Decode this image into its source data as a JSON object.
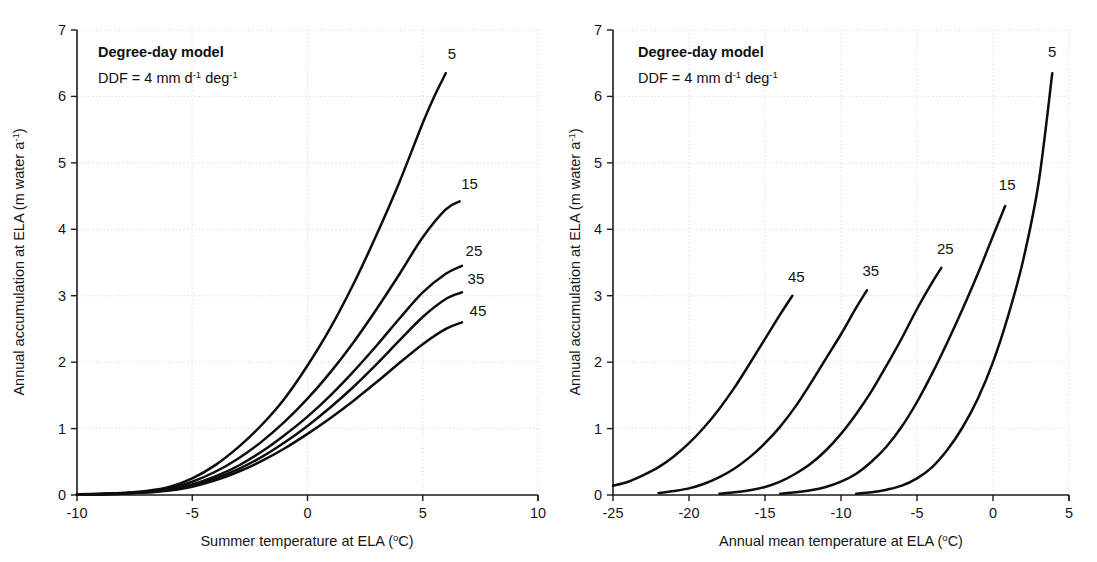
{
  "figure": {
    "background": "#ffffff",
    "line_color": "#0d0d0d",
    "grid_color": "#d2d2d2"
  },
  "panels": [
    {
      "id": "left",
      "annotation_title": "Degree-day model",
      "annotation_sub_main": "DDF = 4 mm d",
      "annotation_sub_exp1": "-1",
      "annotation_sub_mid": " deg",
      "annotation_sub_exp2": "-1",
      "xlabel_main": "Summer temperature at ELA (",
      "xlabel_deg": "o",
      "xlabel_tail": "C)",
      "ylabel_main": "Annual accumulation at ELA (m water a",
      "ylabel_exp": "-1",
      "ylabel_tail": ")",
      "xticks": [
        "-10",
        "-5",
        "0",
        "5",
        "10"
      ],
      "yticks": [
        "0",
        "1",
        "2",
        "3",
        "4",
        "5",
        "6",
        "7"
      ],
      "series_labels": [
        "5",
        "15",
        "25",
        "35",
        "45"
      ]
    },
    {
      "id": "right",
      "annotation_title": "Degree-day model",
      "annotation_sub_main": "DDF = 4 mm d",
      "annotation_sub_exp1": "-1",
      "annotation_sub_mid": " deg",
      "annotation_sub_exp2": "-1",
      "xlabel_main": "Annual mean temperature at ELA (",
      "xlabel_deg": "o",
      "xlabel_tail": "C)",
      "ylabel_main": "Annual accumulation at ELA (m water a",
      "ylabel_exp": "-1",
      "ylabel_tail": ")",
      "xticks": [
        "-25",
        "-20",
        "-15",
        "-10",
        "-5",
        "0",
        "5"
      ],
      "yticks": [
        "0",
        "1",
        "2",
        "3",
        "4",
        "5",
        "6",
        "7"
      ],
      "series_labels": [
        "45",
        "35",
        "25",
        "15",
        "5"
      ]
    }
  ],
  "chart_data": [
    {
      "type": "line",
      "id": "left-panel",
      "title": "Degree-day model",
      "annotation": "DDF = 4 mm d-1 deg-1",
      "xlabel": "Summer temperature at ELA (oC)",
      "ylabel": "Annual accumulation at ELA (m water a-1)",
      "xlim": [
        -10,
        10
      ],
      "ylim": [
        0,
        7
      ],
      "xticks": [
        -10,
        -5,
        0,
        5,
        10
      ],
      "yticks": [
        0,
        1,
        2,
        3,
        4,
        5,
        6,
        7
      ],
      "grid": true,
      "legend": "inline-curve-labels",
      "series": [
        {
          "name": "5",
          "x": [
            -10,
            -9,
            -8,
            -7,
            -6,
            -5,
            -4,
            -3,
            -2,
            -1,
            0,
            1,
            2,
            3,
            4,
            5,
            5.5,
            6.0
          ],
          "values": [
            0.01,
            0.02,
            0.03,
            0.06,
            0.12,
            0.25,
            0.45,
            0.72,
            1.05,
            1.45,
            1.95,
            2.52,
            3.18,
            3.92,
            4.72,
            5.6,
            6.0,
            6.35
          ]
        },
        {
          "name": "15",
          "x": [
            -10,
            -9,
            -8,
            -7,
            -6,
            -5,
            -4,
            -3,
            -2,
            -1,
            0,
            1,
            2,
            3,
            4,
            5,
            6,
            6.6
          ],
          "values": [
            0.01,
            0.015,
            0.03,
            0.05,
            0.1,
            0.2,
            0.35,
            0.55,
            0.8,
            1.1,
            1.45,
            1.85,
            2.3,
            2.8,
            3.33,
            3.88,
            4.3,
            4.42
          ]
        },
        {
          "name": "25",
          "x": [
            -10,
            -9,
            -8,
            -7,
            -6,
            -5,
            -4,
            -3,
            -2,
            -1,
            0,
            1,
            2,
            3,
            4,
            5,
            6,
            6.7
          ],
          "values": [
            0.01,
            0.012,
            0.025,
            0.045,
            0.085,
            0.16,
            0.28,
            0.44,
            0.65,
            0.9,
            1.18,
            1.5,
            1.86,
            2.25,
            2.66,
            3.05,
            3.33,
            3.45
          ]
        },
        {
          "name": "35",
          "x": [
            -10,
            -9,
            -8,
            -7,
            -6,
            -5,
            -4,
            -3,
            -2,
            -1,
            0,
            1,
            2,
            3,
            4,
            5,
            6,
            6.7
          ],
          "values": [
            0.01,
            0.012,
            0.022,
            0.04,
            0.075,
            0.14,
            0.25,
            0.39,
            0.57,
            0.79,
            1.04,
            1.32,
            1.63,
            1.97,
            2.33,
            2.68,
            2.95,
            3.05
          ]
        },
        {
          "name": "45",
          "x": [
            -10,
            -9,
            -8,
            -7,
            -6,
            -5,
            -4,
            -3,
            -2,
            -1,
            0,
            1,
            2,
            3,
            4,
            5,
            6,
            6.7
          ],
          "values": [
            0.01,
            0.012,
            0.02,
            0.036,
            0.068,
            0.125,
            0.22,
            0.35,
            0.51,
            0.7,
            0.92,
            1.16,
            1.42,
            1.7,
            1.99,
            2.27,
            2.5,
            2.6
          ]
        }
      ]
    },
    {
      "type": "line",
      "id": "right-panel",
      "title": "Degree-day model",
      "annotation": "DDF = 4 mm d-1 deg-1",
      "xlabel": "Annual mean temperature at ELA (oC)",
      "ylabel": "Annual accumulation at ELA (m water a-1)",
      "xlim": [
        -25,
        5
      ],
      "ylim": [
        0,
        7
      ],
      "xticks": [
        -25,
        -20,
        -15,
        -10,
        -5,
        0,
        5
      ],
      "yticks": [
        0,
        1,
        2,
        3,
        4,
        5,
        6,
        7
      ],
      "grid": true,
      "legend": "inline-curve-labels",
      "series": [
        {
          "name": "45",
          "x": [
            -25,
            -24,
            -23,
            -22,
            -21,
            -20,
            -19,
            -18,
            -17,
            -16,
            -15,
            -14,
            -13.2
          ],
          "values": [
            0.14,
            0.2,
            0.3,
            0.42,
            0.58,
            0.78,
            1.02,
            1.3,
            1.62,
            1.98,
            2.35,
            2.72,
            3.0
          ]
        },
        {
          "name": "35",
          "x": [
            -22,
            -21,
            -20,
            -19,
            -18,
            -17,
            -16,
            -15,
            -14,
            -13,
            -12,
            -11,
            -10,
            -9,
            -8.3
          ],
          "values": [
            0.03,
            0.06,
            0.1,
            0.17,
            0.27,
            0.4,
            0.57,
            0.78,
            1.03,
            1.33,
            1.68,
            2.05,
            2.42,
            2.82,
            3.08
          ]
        },
        {
          "name": "25",
          "x": [
            -18,
            -17,
            -16,
            -15,
            -14,
            -13,
            -12,
            -11,
            -10,
            -9,
            -8,
            -7,
            -6,
            -5,
            -4,
            -3.4
          ],
          "values": [
            0.02,
            0.04,
            0.07,
            0.12,
            0.2,
            0.32,
            0.47,
            0.67,
            0.92,
            1.22,
            1.56,
            1.95,
            2.36,
            2.8,
            3.2,
            3.42
          ]
        },
        {
          "name": "15",
          "x": [
            -14,
            -13,
            -12,
            -11,
            -10,
            -9,
            -8,
            -7,
            -6,
            -5,
            -4,
            -3,
            -2,
            -1,
            0,
            0.8
          ],
          "values": [
            0.02,
            0.04,
            0.07,
            0.12,
            0.2,
            0.32,
            0.5,
            0.73,
            1.03,
            1.4,
            1.83,
            2.3,
            2.8,
            3.33,
            3.9,
            4.35
          ]
        },
        {
          "name": "5",
          "x": [
            -9,
            -8,
            -7,
            -6,
            -5,
            -4,
            -3,
            -2,
            -1,
            0,
            1,
            2,
            3,
            3.9
          ],
          "values": [
            0.02,
            0.04,
            0.08,
            0.14,
            0.25,
            0.42,
            0.68,
            1.02,
            1.45,
            2.0,
            2.7,
            3.55,
            4.7,
            6.35
          ]
        }
      ]
    }
  ]
}
